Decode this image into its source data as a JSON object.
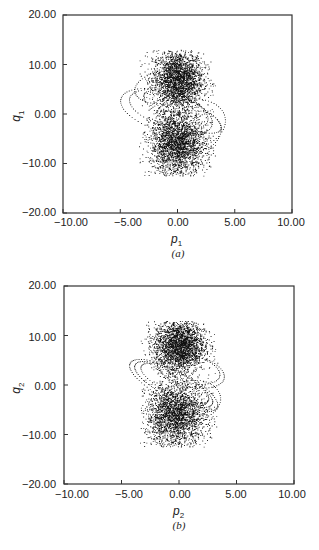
{
  "chart_data": [
    {
      "type": "scatter",
      "panel": "(a)",
      "title": "",
      "xlabel": "p1",
      "ylabel": "q1",
      "xlim": [
        -10,
        10
      ],
      "ylim": [
        -20,
        20
      ],
      "xticks": [
        "-10.00",
        "-5.00",
        "0.00",
        "5.00",
        "10.00"
      ],
      "yticks": [
        "20.00",
        "10.00",
        "0.00",
        "-10.00",
        "-20.00"
      ],
      "grid": false,
      "description": "Poincare section: two dense chaotic clouds centered near (0, 7) and (0, -6), spanning p1 ≈ -3..3, q1 ≈ -12..13, with dotted elliptical quasi-periodic orbits extending to p1 ≈ -5..4",
      "clusters": [
        {
          "cx": 0.0,
          "cy": 7.0,
          "sx": 1.1,
          "sy": 3.0,
          "n": 2600
        },
        {
          "cx": 0.0,
          "cy": -6.0,
          "sx": 1.2,
          "sy": 3.2,
          "n": 2600
        }
      ],
      "orbits": [
        {
          "cx": -1.0,
          "cy": 0.5,
          "rx": 4.2,
          "ry": 4.0,
          "tilt": -0.35,
          "n": 70
        },
        {
          "cx": -0.8,
          "cy": 1.0,
          "rx": 3.6,
          "ry": 3.4,
          "tilt": -0.35,
          "n": 60
        },
        {
          "cx": -1.2,
          "cy": 5.5,
          "rx": 2.6,
          "ry": 3.2,
          "tilt": 0.2,
          "n": 55
        },
        {
          "cx": 1.2,
          "cy": -3.5,
          "rx": 2.6,
          "ry": 4.2,
          "tilt": 0.25,
          "n": 60
        },
        {
          "cx": 1.0,
          "cy": -2.0,
          "rx": 3.2,
          "ry": 5.0,
          "tilt": 0.3,
          "n": 65
        },
        {
          "cx": 0.4,
          "cy": 0.5,
          "rx": 3.8,
          "ry": 2.6,
          "tilt": -0.5,
          "n": 60
        }
      ]
    },
    {
      "type": "scatter",
      "panel": "(b)",
      "title": "",
      "xlabel": "p2",
      "ylabel": "q2",
      "xlim": [
        -10,
        10
      ],
      "ylim": [
        -20,
        20
      ],
      "xticks": [
        "-10.00",
        "-5.00",
        "0.00",
        "5.00",
        "10.00"
      ],
      "yticks": [
        "20.00",
        "10.00",
        "0.00",
        "-10.00",
        "-20.00"
      ],
      "grid": false,
      "description": "Poincare section: two dense chaotic clouds centered near (0, 8) and (0, -6), spanning p2 ≈ -3..3, q2 ≈ -12..13, with dotted tilted elliptical orbits extending to p2 ≈ -5..4",
      "clusters": [
        {
          "cx": 0.0,
          "cy": 8.0,
          "sx": 1.1,
          "sy": 2.6,
          "n": 2600
        },
        {
          "cx": -0.3,
          "cy": -6.0,
          "sx": 1.3,
          "sy": 3.2,
          "n": 2600
        }
      ],
      "orbits": [
        {
          "cx": -0.5,
          "cy": 0.0,
          "rx": 4.4,
          "ry": 3.0,
          "tilt": -0.55,
          "n": 75
        },
        {
          "cx": -0.5,
          "cy": 0.2,
          "rx": 3.9,
          "ry": 2.6,
          "tilt": -0.55,
          "n": 70
        },
        {
          "cx": -0.4,
          "cy": 0.4,
          "rx": 3.4,
          "ry": 2.2,
          "tilt": -0.55,
          "n": 60
        },
        {
          "cx": 1.0,
          "cy": 3.0,
          "rx": 3.0,
          "ry": 3.2,
          "tilt": -0.3,
          "n": 60
        },
        {
          "cx": 1.1,
          "cy": 3.2,
          "rx": 2.5,
          "ry": 2.7,
          "tilt": -0.3,
          "n": 55
        },
        {
          "cx": 1.2,
          "cy": -3.0,
          "rx": 2.4,
          "ry": 4.0,
          "tilt": 0.2,
          "n": 55
        }
      ]
    }
  ],
  "panels": {
    "a": {
      "ylabel_var": "q",
      "ylabel_sub": "1",
      "xlabel_var": "p",
      "xlabel_sub": "1",
      "caption": "(a)",
      "yticks": [
        "20.00",
        "10.00",
        "0.00",
        "−10.00",
        "−20.00"
      ],
      "xticks": [
        "−10.00",
        "−5.00",
        "0.00",
        "5.00",
        "10.00"
      ]
    },
    "b": {
      "ylabel_var": "q",
      "ylabel_sub": "2",
      "xlabel_var": "p",
      "xlabel_sub": "2",
      "caption": "(b)",
      "yticks": [
        "20.00",
        "10.00",
        "0.00",
        "−10.00",
        "−20.00"
      ],
      "xticks": [
        "−10.00",
        "−5.00",
        "0.00",
        "5.00",
        "10.00"
      ]
    }
  },
  "colors": {
    "points": "#111111",
    "axis": "#333333"
  }
}
